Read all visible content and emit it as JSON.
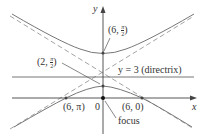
{
  "diagram": {
    "type": "conic hyperbola in polar form",
    "axes": {
      "x_label": "x",
      "y_label": "y",
      "origin_label": "0"
    },
    "directrix": {
      "label": "y = 3 (directrix)"
    },
    "focus_label": "focus",
    "points": [
      {
        "r": "6",
        "theta_num": "π",
        "theta_den": "2",
        "label": "(6, π/2)"
      },
      {
        "r": "2",
        "theta_num": "π",
        "theta_den": "2",
        "label": "(2, π/2)"
      },
      {
        "label": "(6, π)"
      },
      {
        "label": "(6, 0)"
      }
    ],
    "colors": {
      "curve": "#777777",
      "asymptote": "#999999",
      "axis": "#444444"
    }
  }
}
